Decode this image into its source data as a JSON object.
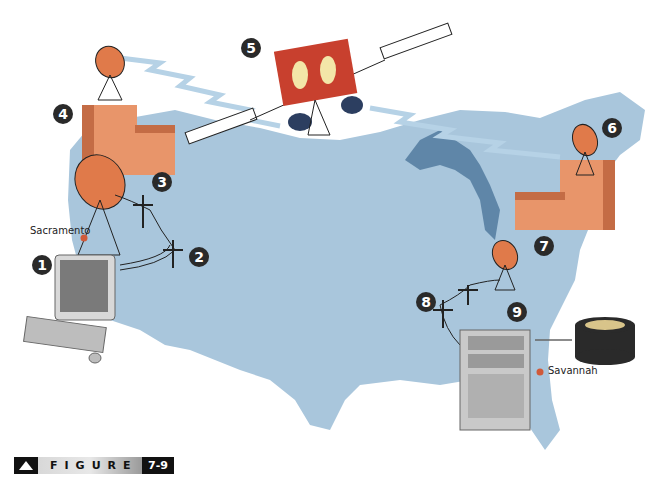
{
  "figure": {
    "label": "FIGURE",
    "number": "7-9"
  },
  "cities": {
    "west": "Sacramento",
    "east": "Savannah"
  },
  "steps": [
    "1",
    "2",
    "3",
    "4",
    "5",
    "6",
    "7",
    "8",
    "9"
  ],
  "colors": {
    "map": "#a9c6dc",
    "lakes": "#5f86a8",
    "building": "#e8956a",
    "building_dark": "#c46c45",
    "satellite_body": "#c8402e",
    "satellite_window": "#f3e6a8",
    "dish": "#e07a4a",
    "signal": "#b6d2e6",
    "city_dot": "#d05a3a",
    "badge": "#2a2a2a"
  }
}
